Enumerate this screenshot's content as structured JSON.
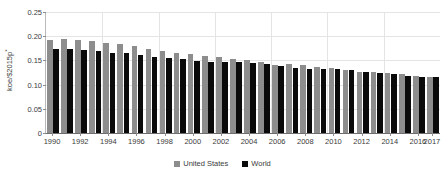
{
  "chart_data": {
    "type": "bar",
    "title": "",
    "subtitle": "",
    "xlabel": "",
    "ylabel": "koe/$2015p",
    "ylabel_superscript": "*",
    "ylim": [
      0,
      0.25
    ],
    "yticks": [
      0,
      0.05,
      0.1,
      0.15,
      0.2,
      0.25
    ],
    "ytick_labels": [
      "0",
      "0.05",
      "0.10",
      "0.15",
      "0.20",
      "0.25"
    ],
    "grid": "horizontal-and-vertical",
    "legend_position": "bottom-center",
    "categories": [
      "1990",
      "1991",
      "1992",
      "1993",
      "1994",
      "1995",
      "1996",
      "1997",
      "1998",
      "1999",
      "2000",
      "2001",
      "2002",
      "2003",
      "2004",
      "2005",
      "2006",
      "2007",
      "2008",
      "2009",
      "2010",
      "2011",
      "2012",
      "2013",
      "2014",
      "2015",
      "2016",
      "2017"
    ],
    "xtick_labels": [
      "1990",
      "1992",
      "1994",
      "1996",
      "1998",
      "2000",
      "2002",
      "2004",
      "2006",
      "2008",
      "2010",
      "2012",
      "2014",
      "2016",
      "2017"
    ],
    "series": [
      {
        "name": "United States",
        "color": "#8d8d8d",
        "values": [
          0.193,
          0.195,
          0.192,
          0.19,
          0.186,
          0.184,
          0.18,
          0.174,
          0.169,
          0.165,
          0.163,
          0.159,
          0.158,
          0.153,
          0.15,
          0.146,
          0.141,
          0.142,
          0.14,
          0.136,
          0.135,
          0.131,
          0.127,
          0.127,
          0.124,
          0.121,
          0.118,
          0.116
        ]
      },
      {
        "name": "World",
        "color": "#0a0a0a",
        "values": [
          0.173,
          0.173,
          0.171,
          0.17,
          0.166,
          0.165,
          0.162,
          0.157,
          0.154,
          0.152,
          0.149,
          0.147,
          0.147,
          0.146,
          0.145,
          0.142,
          0.138,
          0.135,
          0.133,
          0.132,
          0.132,
          0.13,
          0.127,
          0.124,
          0.122,
          0.118,
          0.116,
          0.115
        ]
      }
    ]
  },
  "legend": {
    "items": [
      {
        "label": "United States",
        "color": "#8d8d8d"
      },
      {
        "label": "World",
        "color": "#0a0a0a"
      }
    ]
  },
  "axis": {
    "y_title": "koe/$2015p",
    "y_title_superscript": "*"
  }
}
